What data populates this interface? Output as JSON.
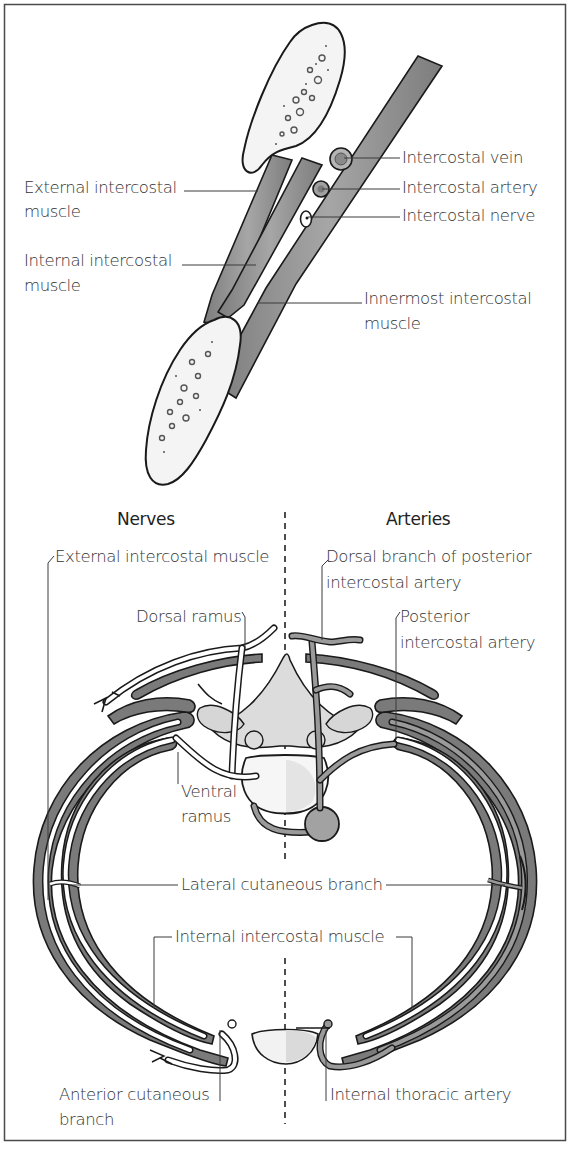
{
  "figure": {
    "top_panel": {
      "labels": {
        "intercostal_vein": "Intercostal vein",
        "intercostal_artery": "Intercostal artery",
        "intercostal_nerve": "Intercostal nerve",
        "external_intercostal_1": "External intercostal",
        "external_intercostal_2": "muscle",
        "internal_intercostal_1": "Internal intercostal",
        "internal_intercostal_2": "muscle",
        "innermost_intercostal_1": "Innermost intercostal",
        "innermost_intercostal_2": "muscle"
      }
    },
    "bottom_panel": {
      "headers": {
        "left": "Nerves",
        "right": "Arteries"
      },
      "labels": {
        "external_intercostal_muscle": "External intercostal muscle",
        "dorsal_branch_1": "Dorsal branch of posterior",
        "dorsal_branch_2": "intercostal artery",
        "dorsal_ramus": "Dorsal ramus",
        "posterior_intercostal_1": "Posterior",
        "posterior_intercostal_2": "intercostal artery",
        "ventral_ramus_1": "Ventral",
        "ventral_ramus_2": "ramus",
        "lateral_cutaneous_branch": "Lateral cutaneous branch",
        "internal_intercostal_muscle": "Internal intercostal muscle",
        "anterior_cutaneous_1": "Anterior cutaneous",
        "anterior_cutaneous_2": "branch",
        "internal_thoracic_artery": "Internal thoracic artery"
      }
    },
    "colors": {
      "muscle": "#8c8c8c",
      "bone": "#f4f4f4",
      "artery": "#9a9a9a",
      "outline": "#1a1a1a",
      "text": "#333333"
    }
  }
}
